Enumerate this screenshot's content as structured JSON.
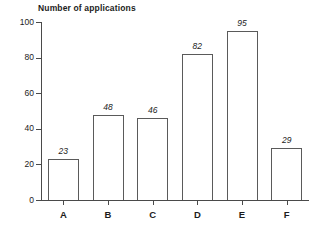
{
  "chart_data": {
    "type": "bar",
    "title": "Number of applications",
    "xlabel": "",
    "ylabel": "",
    "categories": [
      "A",
      "B",
      "C",
      "D",
      "E",
      "F"
    ],
    "values": [
      23,
      48,
      46,
      82,
      95,
      29
    ],
    "value_labels": [
      "23",
      "48",
      "46",
      "82",
      "95",
      "29"
    ],
    "ylim": [
      0,
      100
    ],
    "yticks": [
      0,
      20,
      40,
      60,
      80,
      100
    ],
    "ytick_labels": [
      "0",
      "20",
      "40",
      "60",
      "80",
      "100"
    ],
    "grid": false,
    "legend": "none",
    "bar_fill_color": "#ffffff",
    "bar_border_color": "#5a5a5a",
    "axis_color": "#4a4a4a",
    "text_color": "#1c1c1c",
    "background_color": "#ffffff"
  }
}
